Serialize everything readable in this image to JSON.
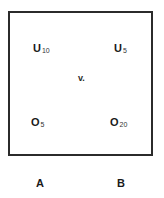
{
  "diagram": {
    "items": [
      {
        "id": "top-left",
        "symbol": "U",
        "subscript": "10"
      },
      {
        "id": "top-right",
        "symbol": "U",
        "subscript": "5"
      },
      {
        "id": "bottom-left",
        "symbol": "O",
        "subscript": "5"
      },
      {
        "id": "bottom-right",
        "symbol": "O",
        "subscript": "20"
      }
    ],
    "center_label": "v.",
    "column_labels": [
      "A",
      "B"
    ]
  }
}
